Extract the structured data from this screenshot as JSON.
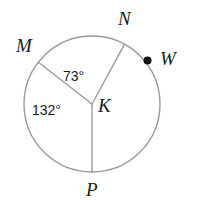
{
  "figure": {
    "type": "circle-geometry-diagram",
    "background_color": "#ffffff",
    "stroke_color": "#9a9a9a",
    "text_color": "#1a1a1a",
    "circle": {
      "center_label": "K",
      "center_x": 92,
      "center_y": 104,
      "radius": 68
    },
    "points": [
      {
        "id": "M",
        "label": "M",
        "on_circle": true,
        "marker": "none"
      },
      {
        "id": "N",
        "label": "N",
        "on_circle": true,
        "marker": "none"
      },
      {
        "id": "W",
        "label": "W",
        "on_circle": true,
        "marker": "dot"
      },
      {
        "id": "P",
        "label": "P",
        "on_circle": true,
        "marker": "none"
      },
      {
        "id": "K",
        "label": "K",
        "on_circle": false,
        "marker": "none"
      }
    ],
    "radii": [
      {
        "from": "K",
        "to": "M"
      },
      {
        "from": "K",
        "to": "N"
      },
      {
        "from": "K",
        "to": "P"
      }
    ],
    "angles": [
      {
        "id": "MKN",
        "label": "73°",
        "value": 73,
        "unit": "degrees",
        "between": [
          "M",
          "N"
        ]
      },
      {
        "id": "MKP",
        "label": "132°",
        "value": 132,
        "unit": "degrees",
        "between": [
          "M",
          "P"
        ]
      }
    ]
  }
}
